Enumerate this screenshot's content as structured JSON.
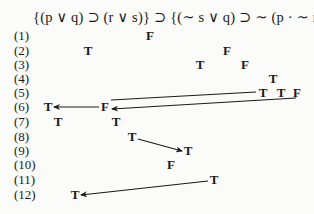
{
  "formula": "{(p ∨ q) ⊃ (r ∨ s)} ⊃ {(∼ s ∨ q) ⊃ ∼ (p · ∼ r)}",
  "rows": [
    {
      "label": "(1)",
      "y": 36
    },
    {
      "label": "(2)",
      "y": 51
    },
    {
      "label": "(3)",
      "y": 65
    },
    {
      "label": "(4)",
      "y": 79
    },
    {
      "label": "(5)",
      "y": 93
    },
    {
      "label": "(6)",
      "y": 107
    },
    {
      "label": "(7)",
      "y": 122
    },
    {
      "label": "(8)",
      "y": 137
    },
    {
      "label": "(9)",
      "y": 151
    },
    {
      "label": "(10)",
      "y": 165
    },
    {
      "label": "(11)",
      "y": 180
    },
    {
      "label": "(12)",
      "y": 195
    }
  ],
  "values": [
    {
      "row": 1,
      "text": "F",
      "x": 150
    },
    {
      "row": 2,
      "text": "T",
      "x": 88
    },
    {
      "row": 2,
      "text": "F",
      "x": 227
    },
    {
      "row": 3,
      "text": "T",
      "x": 200
    },
    {
      "row": 3,
      "text": "F",
      "x": 245
    },
    {
      "row": 4,
      "text": "T",
      "x": 273
    },
    {
      "row": 5,
      "text": "T",
      "x": 263
    },
    {
      "row": 5,
      "text": "T",
      "x": 281
    },
    {
      "row": 5,
      "text": "F",
      "x": 297
    },
    {
      "row": 6,
      "text": "T",
      "x": 48
    },
    {
      "row": 6,
      "text": "F",
      "x": 105
    },
    {
      "row": 7,
      "text": "T",
      "x": 58
    },
    {
      "row": 7,
      "text": "T",
      "x": 116
    },
    {
      "row": 8,
      "text": "T",
      "x": 132
    },
    {
      "row": 9,
      "text": "T",
      "x": 188
    },
    {
      "row": 10,
      "text": "F",
      "x": 171
    },
    {
      "row": 11,
      "text": "T",
      "x": 214
    },
    {
      "row": 12,
      "text": "T",
      "x": 75
    }
  ],
  "arrows": [
    {
      "from": "row5-T1",
      "to": "row6-F",
      "x1": 256,
      "y1": 92,
      "x2": 111,
      "y2": 100,
      "head": false
    },
    {
      "from": "row6-F",
      "to": "row6-T",
      "x1": 99,
      "y1": 107,
      "x2": 54,
      "y2": 107,
      "head": true
    },
    {
      "from": "row5-F",
      "to": "row6-F",
      "x1": 296,
      "y1": 98,
      "x2": 112,
      "y2": 109,
      "head": true
    },
    {
      "from": "row8-T",
      "to": "row9-T",
      "x1": 138,
      "y1": 139,
      "x2": 182,
      "y2": 151,
      "head": true
    },
    {
      "from": "row11-T",
      "to": "row12-T",
      "x1": 208,
      "y1": 181,
      "x2": 81,
      "y2": 195,
      "head": true
    }
  ]
}
